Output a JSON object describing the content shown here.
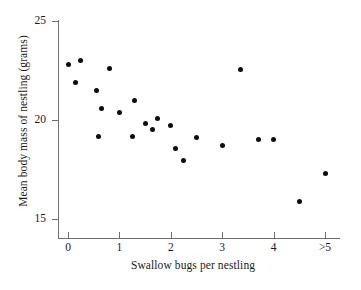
{
  "chart_data": {
    "type": "scatter",
    "title": "",
    "xlabel": "Swallow bugs per nestling",
    "ylabel": "Mean body mass of nestling (grams)",
    "xlim": [
      -0.28,
      5.3
    ],
    "ylim": [
      14.2,
      25.0
    ],
    "grid": false,
    "legend": null,
    "xticks": [
      {
        "value": 0,
        "label": "0"
      },
      {
        "value": 1,
        "label": "1"
      },
      {
        "value": 2,
        "label": "2"
      },
      {
        "value": 3,
        "label": "3"
      },
      {
        "value": 4,
        "label": "4"
      },
      {
        "value": 5,
        "label": ">5"
      }
    ],
    "yticks": [
      {
        "value": 15,
        "label": "15"
      },
      {
        "value": 20,
        "label": "20"
      },
      {
        "value": 25,
        "label": "25"
      }
    ],
    "marker": {
      "shape": "circle",
      "color": "#0d0d0d",
      "size": 5
    },
    "points": [
      {
        "x": 0.0,
        "y": 22.8
      },
      {
        "x": 0.15,
        "y": 21.9
      },
      {
        "x": 0.25,
        "y": 23.0
      },
      {
        "x": 0.55,
        "y": 21.5
      },
      {
        "x": 0.6,
        "y": 19.15
      },
      {
        "x": 0.65,
        "y": 20.6
      },
      {
        "x": 0.8,
        "y": 22.6
      },
      {
        "x": 1.0,
        "y": 20.4
      },
      {
        "x": 1.25,
        "y": 19.15
      },
      {
        "x": 1.3,
        "y": 21.0
      },
      {
        "x": 1.5,
        "y": 19.8
      },
      {
        "x": 1.65,
        "y": 19.5
      },
      {
        "x": 1.75,
        "y": 20.1
      },
      {
        "x": 2.0,
        "y": 19.7
      },
      {
        "x": 2.1,
        "y": 18.55
      },
      {
        "x": 2.25,
        "y": 17.95
      },
      {
        "x": 2.5,
        "y": 19.1
      },
      {
        "x": 3.0,
        "y": 18.7
      },
      {
        "x": 3.35,
        "y": 22.55
      },
      {
        "x": 3.7,
        "y": 19.0
      },
      {
        "x": 4.0,
        "y": 19.0
      },
      {
        "x": 4.5,
        "y": 15.9
      },
      {
        "x": 5.0,
        "y": 17.3
      }
    ]
  },
  "edge_sliver": {
    "lines": [
      "",
      "",
      "",
      "",
      "",
      "",
      ""
    ]
  }
}
